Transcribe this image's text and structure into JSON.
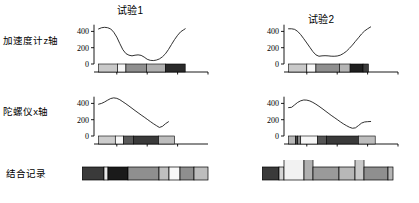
{
  "figure": {
    "width": 419,
    "height": 203,
    "background": "#ffffff",
    "line_color": "#1a1a1a",
    "axis_color": "#000000"
  },
  "column_titles": [
    {
      "id": "trial1",
      "label": "试验1"
    },
    {
      "id": "trial2",
      "label": "试验2"
    }
  ],
  "row_labels": [
    {
      "id": "accel",
      "label": "加速度计z轴"
    },
    {
      "id": "gyro",
      "label": "陀螺仪x轴"
    },
    {
      "id": "combined",
      "label": "结合记录"
    }
  ],
  "chart_data": [
    {
      "id": "accel-trial1",
      "type": "line",
      "title": "试验1",
      "ylabel": "加速度计z轴",
      "xlabel": "",
      "xlim": [
        5,
        80
      ],
      "ylim": [
        0,
        470
      ],
      "yticks": [
        0,
        200,
        400
      ],
      "ytick_labels": [
        "0",
        "200",
        "400"
      ],
      "xticks": [
        20,
        40,
        60,
        80
      ],
      "xtick_labels": [
        "20",
        "40",
        "60",
        "80"
      ],
      "grid": false,
      "legend": "none",
      "series": [
        {
          "name": "accelerometer-z",
          "x": [
            8,
            10,
            12,
            14,
            16,
            18,
            20,
            22,
            24,
            26,
            28,
            30,
            32,
            34,
            36,
            38,
            40,
            42,
            44,
            46,
            48,
            50,
            52,
            54,
            56,
            58,
            60,
            62,
            64,
            65
          ],
          "y": [
            430,
            445,
            450,
            445,
            430,
            390,
            330,
            250,
            175,
            128,
            108,
            100,
            108,
            112,
            106,
            85,
            58,
            45,
            42,
            48,
            62,
            88,
            125,
            178,
            240,
            300,
            352,
            395,
            420,
            432
          ]
        }
      ],
      "segments": [
        {
          "start": 8,
          "end": 20.5,
          "color": "#c9c9c9"
        },
        {
          "start": 20.5,
          "end": 26.0,
          "color": "#f5f5f5"
        },
        {
          "start": 26.0,
          "end": 39.5,
          "color": "#8f8f8f"
        },
        {
          "start": 39.5,
          "end": 52.0,
          "color": "#b0b0b0"
        },
        {
          "start": 52.0,
          "end": 65.0,
          "color": "#2a2a2a"
        }
      ]
    },
    {
      "id": "accel-trial2",
      "type": "line",
      "title": "试验2",
      "ylabel": "加速度计z轴",
      "xlabel": "",
      "xlim": [
        5,
        80
      ],
      "ylim": [
        0,
        470
      ],
      "yticks": [
        0,
        200,
        400
      ],
      "ytick_labels": [
        "0",
        "200",
        "400"
      ],
      "xticks": [
        20,
        40,
        60,
        80
      ],
      "xtick_labels": [
        "20",
        "40",
        "60",
        "80"
      ],
      "grid": false,
      "legend": "none",
      "series": [
        {
          "name": "accelerometer-z",
          "x": [
            8,
            10,
            12,
            14,
            16,
            18,
            20,
            22,
            24,
            26,
            28,
            30,
            32,
            34,
            36,
            38,
            40,
            42,
            44,
            46,
            48,
            50,
            52,
            54,
            56,
            58,
            60,
            62
          ],
          "y": [
            432,
            432,
            425,
            400,
            360,
            310,
            258,
            205,
            152,
            112,
            95,
            100,
            102,
            100,
            96,
            95,
            98,
            108,
            128,
            155,
            192,
            232,
            278,
            322,
            368,
            405,
            432,
            455
          ]
        }
      ],
      "segments": [
        {
          "start": 8,
          "end": 20.0,
          "color": "#c9c9c9"
        },
        {
          "start": 20.0,
          "end": 26.0,
          "color": "#f7f7f7"
        },
        {
          "start": 26.0,
          "end": 41.5,
          "color": "#8f8f8f"
        },
        {
          "start": 41.5,
          "end": 48.5,
          "color": "#b5b5b5"
        },
        {
          "start": 48.5,
          "end": 57.0,
          "color": "#1f1f1f"
        },
        {
          "start": 57.0,
          "end": 60.5,
          "color": "#3c3c3c"
        }
      ]
    },
    {
      "id": "gyro-trial1",
      "type": "line",
      "title": "",
      "ylabel": "陀螺仪x轴",
      "xlabel": "",
      "xlim": [
        5,
        80
      ],
      "ylim": [
        0,
        470
      ],
      "yticks": [
        0,
        200,
        400
      ],
      "ytick_labels": [
        "0",
        "200",
        "400"
      ],
      "xticks": [
        20,
        40,
        60
      ],
      "xtick_labels": [
        "20",
        "40",
        "60"
      ],
      "grid": false,
      "legend": "none",
      "series": [
        {
          "name": "gyroscope-x",
          "x": [
            8,
            10,
            12,
            14,
            16,
            18,
            20,
            22,
            24,
            26,
            28,
            30,
            32,
            34,
            36,
            38,
            40,
            42,
            44,
            46,
            48,
            50,
            52,
            54
          ],
          "y": [
            390,
            400,
            418,
            440,
            460,
            468,
            462,
            445,
            420,
            395,
            368,
            340,
            312,
            285,
            258,
            232,
            205,
            178,
            152,
            128,
            105,
            118,
            150,
            175
          ]
        }
      ],
      "segments": [
        {
          "start": 8,
          "end": 19.0,
          "color": "#cccccc"
        },
        {
          "start": 19.0,
          "end": 24.5,
          "color": "#f7f7f7"
        },
        {
          "start": 24.5,
          "end": 31.0,
          "color": "#5a5a5a"
        },
        {
          "start": 31.0,
          "end": 47.5,
          "color": "#3a3a3a"
        },
        {
          "start": 47.5,
          "end": 58.0,
          "color": "#bdbdbd"
        }
      ]
    },
    {
      "id": "gyro-trial2",
      "type": "line",
      "title": "",
      "ylabel": "陀螺仪x轴",
      "xlabel": "",
      "xlim": [
        5,
        80
      ],
      "ylim": [
        0,
        470
      ],
      "yticks": [
        0,
        200,
        400
      ],
      "ytick_labels": [
        "0",
        "200",
        "400"
      ],
      "xticks": [
        20,
        40,
        60,
        80
      ],
      "xtick_labels": [
        "20",
        "40",
        "60",
        "80"
      ],
      "grid": false,
      "legend": "none",
      "series": [
        {
          "name": "gyroscope-x",
          "x": [
            8,
            10,
            12,
            14,
            16,
            18,
            20,
            22,
            24,
            26,
            28,
            30,
            32,
            34,
            36,
            38,
            40,
            42,
            44,
            46,
            48,
            50,
            52,
            54,
            56,
            58,
            60,
            62
          ],
          "y": [
            348,
            352,
            382,
            412,
            432,
            442,
            440,
            430,
            412,
            390,
            365,
            338,
            310,
            282,
            254,
            228,
            202,
            175,
            150,
            128,
            108,
            95,
            100,
            128,
            158,
            172,
            176,
            178
          ]
        }
      ],
      "segments": [
        {
          "start": 8,
          "end": 12.5,
          "color": "#b8b8b8"
        },
        {
          "start": 12.5,
          "end": 14.0,
          "color": "#4a4a4a"
        },
        {
          "start": 14.0,
          "end": 16.0,
          "color": "#8a8a8a"
        },
        {
          "start": 16.0,
          "end": 27.0,
          "color": "#f5f5f5"
        },
        {
          "start": 27.0,
          "end": 33.0,
          "color": "#555555"
        },
        {
          "start": 33.0,
          "end": 54.0,
          "color": "#3a3a3a"
        },
        {
          "start": 54.0,
          "end": 65.0,
          "color": "#bdbdbd"
        }
      ]
    }
  ],
  "combined_records": [
    {
      "id": "combined-trial1",
      "type": "bar",
      "title": "结合记录",
      "segments": [
        {
          "color": "#3a3a3a",
          "width": 22,
          "height": 13
        },
        {
          "color": "#e8e8e8",
          "width": 4,
          "height": 13
        },
        {
          "color": "#1a1a1a",
          "width": 20,
          "height": 13
        },
        {
          "color": "#8f8f8f",
          "width": 31,
          "height": 13
        },
        {
          "color": "#bfbfbf",
          "width": 10,
          "height": 13
        },
        {
          "color": "#f7f7f7",
          "width": 11,
          "height": 13
        },
        {
          "color": "#8f8f8f",
          "width": 14,
          "height": 13
        },
        {
          "color": "#bdbdbd",
          "width": 14,
          "height": 13
        }
      ]
    },
    {
      "id": "combined-trial2",
      "type": "bar",
      "segments": [
        {
          "color": "#3a3a3a",
          "width": 17,
          "height": 13
        },
        {
          "color": "#d5d5d5",
          "width": 5,
          "height": 13
        },
        {
          "color": "#f2f2f2",
          "width": 20,
          "height": 21
        },
        {
          "color": "#b0b0b0",
          "width": 9,
          "height": 21
        },
        {
          "color": "#9a9a9a",
          "width": 26,
          "height": 13
        },
        {
          "color": "#b8b8b8",
          "width": 16,
          "height": 13
        },
        {
          "color": "#c9c9c9",
          "width": 9,
          "height": 21
        },
        {
          "color": "#8f8f8f",
          "width": 24,
          "height": 13
        },
        {
          "color": "#b5b5b5",
          "width": 5,
          "height": 13
        }
      ]
    }
  ]
}
